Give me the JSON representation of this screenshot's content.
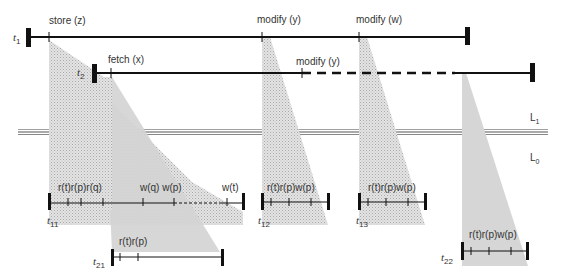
{
  "colors": {
    "line": "#111111",
    "shade_dotted": "#c9c9c9",
    "shade_solid": "#d6d6d6",
    "level_line": "#666666",
    "text": "#333333"
  },
  "levels": {
    "upper": {
      "label": "L",
      "sub": "1"
    },
    "lower": {
      "label": "L",
      "sub": "0"
    }
  },
  "transactions": {
    "t1": {
      "name": "t",
      "sub": "1",
      "ops": [
        {
          "label": "store (z)"
        },
        {
          "label": "modify (y)"
        },
        {
          "label": "modify (w)"
        }
      ]
    },
    "t2": {
      "name": "t",
      "sub": "2",
      "ops": [
        {
          "label": "fetch (x)"
        },
        {
          "label": "modify (y)"
        }
      ]
    }
  },
  "subtransactions": {
    "t11": {
      "name": "t",
      "sub": "11",
      "ops_left": "r(t)r(p)r(q)",
      "ops_mid": "w(q) w(p)",
      "ops_right": "w(t)"
    },
    "t12": {
      "name": "t",
      "sub": "12",
      "ops": "r(t)r(p)w(p)"
    },
    "t13": {
      "name": "t",
      "sub": "13",
      "ops": "r(t)r(p)w(p)"
    },
    "t21": {
      "name": "t",
      "sub": "21",
      "ops": "r(t)r(p)"
    },
    "t22": {
      "name": "t",
      "sub": "22",
      "ops": "r(t)r(p)w(p)"
    }
  }
}
